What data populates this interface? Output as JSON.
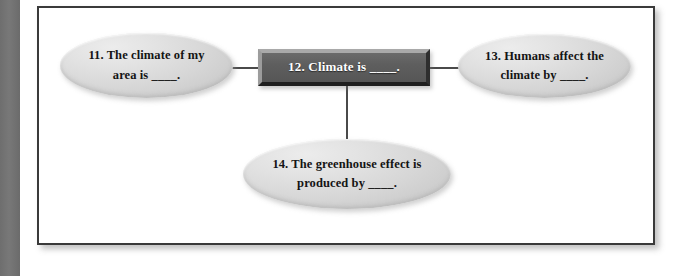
{
  "page": {
    "background_color": "#ffffff",
    "gutter_bar_color": "#747474",
    "frame_border_color": "#3a3a3a"
  },
  "diagram": {
    "type": "concept-map",
    "center_node": {
      "id": "node-12",
      "number": "12.",
      "shape": "rectangle",
      "label": "12. Climate is ____.",
      "fill_color": "#5e5e5e",
      "text_color": "#ffffff"
    },
    "nodes": [
      {
        "id": "node-11",
        "number": "11.",
        "shape": "ellipse",
        "position": "left",
        "line1": "11. The climate of my",
        "line2": "area is ____.",
        "label": "11. The climate of my area is ____.",
        "fill_color": "#d6d6d6",
        "text_color": "#141414"
      },
      {
        "id": "node-13",
        "number": "13.",
        "shape": "ellipse",
        "position": "right",
        "line1": "13. Humans affect the",
        "line2": "climate by ____.",
        "label": "13. Humans affect the climate by ____.",
        "fill_color": "#d6d6d6",
        "text_color": "#141414"
      },
      {
        "id": "node-14",
        "number": "14.",
        "shape": "ellipse",
        "position": "bottom",
        "line1": "14. The greenhouse effect is",
        "line2": "produced by ____.",
        "label": "14. The greenhouse effect is produced by ____.",
        "fill_color": "#d6d6d6",
        "text_color": "#141414"
      }
    ],
    "connectors": [
      {
        "id": "connector-left",
        "from": "node-11",
        "to": "node-12",
        "orientation": "horizontal",
        "color": "#4a4a4a"
      },
      {
        "id": "connector-right",
        "from": "node-12",
        "to": "node-13",
        "orientation": "horizontal",
        "color": "#4a4a4a"
      },
      {
        "id": "connector-bottom",
        "from": "node-12",
        "to": "node-14",
        "orientation": "vertical",
        "color": "#4a4a4a"
      }
    ]
  }
}
